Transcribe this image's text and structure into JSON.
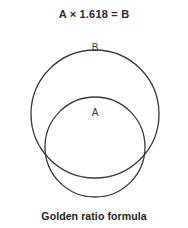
{
  "figure": {
    "title": "A × 1.618 = B",
    "caption": "Golden ratio formula",
    "background_color": "#ffffff",
    "stroke_color": "#3a3a3a",
    "title_color": "#2b2b2b",
    "caption_color": "#222222"
  },
  "chart_data": {
    "type": "diagram",
    "title": "A × 1.618 = B",
    "subtitle": "Golden ratio formula",
    "ratio": 1.618,
    "shapes": [
      {
        "name": "B",
        "label": "B",
        "shape": "circle",
        "cx": 95,
        "cy": 114,
        "r": 64,
        "fill": "none",
        "stroke": "#3a3a3a",
        "stroke_width": 1.3,
        "label_x": 95,
        "label_y": 48
      },
      {
        "name": "A",
        "label": "A",
        "shape": "circle",
        "cx": 95,
        "cy": 147,
        "r": 50,
        "fill": "none",
        "stroke": "#3a3a3a",
        "stroke_width": 1.3,
        "label_x": 95,
        "label_y": 113
      }
    ],
    "relation": "A × 1.618 = B",
    "legend": [
      "A",
      "B"
    ],
    "grid": false,
    "axis": false
  }
}
